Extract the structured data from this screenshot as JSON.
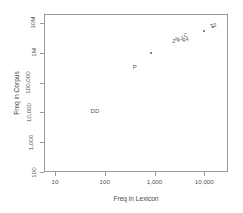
{
  "chart_data": {
    "type": "scatter",
    "title": "",
    "xlabel": "Freq in Lexicon",
    "ylabel": "Freq in Corpus",
    "xscale": "log",
    "yscale": "log",
    "xlim": [
      6,
      30000
    ],
    "ylim": [
      100,
      20000000
    ],
    "grid": false,
    "legend": null,
    "xticks": [
      {
        "value": 10,
        "label": "10"
      },
      {
        "value": 100,
        "label": "100"
      },
      {
        "value": 1000,
        "label": "1,000"
      },
      {
        "value": 10000,
        "label": "10,000"
      }
    ],
    "yticks": [
      {
        "value": 100,
        "label": "100"
      },
      {
        "value": 1000,
        "label": "1,000"
      },
      {
        "value": 10000,
        "label": "10,000"
      },
      {
        "value": 100000,
        "label": "100,000"
      },
      {
        "value": 1000000,
        "label": "1M"
      },
      {
        "value": 10000000,
        "label": "10M"
      }
    ],
    "points": [
      {
        "label": "DD",
        "x": 62,
        "y": 11000,
        "size": "big"
      },
      {
        "label": "P",
        "x": 400,
        "y": 330000,
        "size": "big"
      },
      {
        "label": "",
        "x": 850,
        "y": 1000000,
        "size": "dot"
      },
      {
        "label": "Z",
        "x": 2500,
        "y": 2600000,
        "size": "small"
      },
      {
        "label": "N",
        "x": 2900,
        "y": 3100000,
        "size": "small"
      },
      {
        "label": "V",
        "x": 3150,
        "y": 2850000,
        "size": "small"
      },
      {
        "label": "J",
        "x": 3600,
        "y": 3400000,
        "size": "small"
      },
      {
        "label": "C",
        "x": 4300,
        "y": 4100000,
        "size": "small"
      },
      {
        "label": "R",
        "x": 4000,
        "y": 2900000,
        "size": "small"
      },
      {
        "label": "A",
        "x": 4700,
        "y": 3000000,
        "size": "small"
      },
      {
        "label": "",
        "x": 10000,
        "y": 5600000,
        "size": "dot"
      },
      {
        "label": "T",
        "x": 14500,
        "y": 8500000,
        "size": "small"
      },
      {
        "label": "S",
        "x": 17000,
        "y": 9500000,
        "size": "small"
      },
      {
        "label": "",
        "x": 15500,
        "y": 7600000,
        "size": "dot"
      }
    ]
  }
}
